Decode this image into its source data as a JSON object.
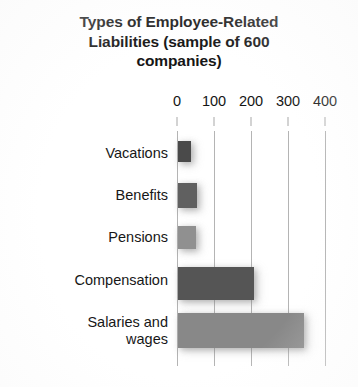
{
  "chart_data": {
    "type": "bar",
    "orientation": "horizontal",
    "title": "Types of Employee-Related Liabilities (sample of 600 companies)",
    "title_lines": [
      "Types of Employee-Related",
      "Liabilities (sample of 600",
      "companies)"
    ],
    "categories": [
      "Vacations",
      "Benefits",
      "Pensions",
      "Compensation",
      "Salaries and wages"
    ],
    "category_display": [
      "Vacations",
      "Benefits",
      "Pensions",
      "Compensation",
      "Salaries and\nwages"
    ],
    "values": [
      35,
      50,
      48,
      205,
      340
    ],
    "bar_colors": [
      "#4a4a4a",
      "#606060",
      "#909090",
      "#555555",
      "#888888"
    ],
    "xlabel": "",
    "ylabel": "",
    "xlim": [
      0,
      400
    ],
    "ticks": [
      0,
      100,
      200,
      300,
      400
    ],
    "tick_labels": [
      "0",
      "100",
      "200",
      "300",
      "400"
    ],
    "tick_interval": 100,
    "axis_position": "top",
    "grid": true,
    "grid_axis": "x",
    "grid_color": "#b4b4b4",
    "legend": false,
    "background": "#ffffff",
    "units_note": "number of companies (sample of 600)"
  }
}
